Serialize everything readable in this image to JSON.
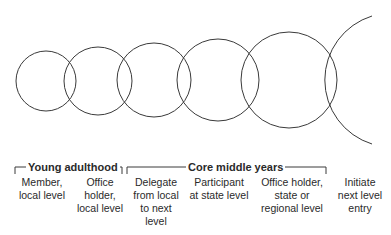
{
  "diagram": {
    "type": "overlapping-circles-progression",
    "circle_color": "#3a3a3a",
    "groups": [
      {
        "label": "Young adulthood",
        "bracket_x": [
          14,
          122
        ]
      },
      {
        "label": "Core middle years",
        "bracket_x": [
          127,
          336
        ]
      }
    ],
    "stages": [
      {
        "label": "Member,\nlocal level"
      },
      {
        "label": "Office\nholder,\nlocal level"
      },
      {
        "label": "Delegate\nfrom local\nto next\nlevel"
      },
      {
        "label": "Participant\nat state level"
      },
      {
        "label": "Office holder,\nstate or\nregional level"
      },
      {
        "label": "Initiate\nnext level\nentry"
      }
    ]
  }
}
